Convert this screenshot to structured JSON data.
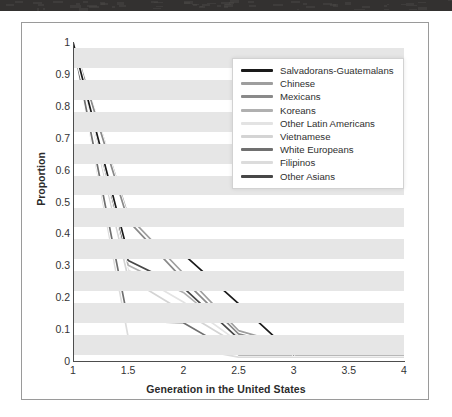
{
  "figure": {
    "y_axis_title": "Proportion",
    "x_axis_title": "Generation in the United States"
  },
  "legend": {
    "items": [
      {
        "label": "Salvadorans-Guatemalans",
        "color": "#1a1a1a"
      },
      {
        "label": "Chinese",
        "color": "#9e9e9e"
      },
      {
        "label": "Mexicans",
        "color": "#8a8a8a"
      },
      {
        "label": "Koreans",
        "color": "#b0b0b0"
      },
      {
        "label": "Other Latin Americans",
        "color": "#e3e3e3"
      },
      {
        "label": "Vietnamese",
        "color": "#d4d4d4"
      },
      {
        "label": "White Europeans",
        "color": "#707070"
      },
      {
        "label": "Filipinos",
        "color": "#dcdcdc"
      },
      {
        "label": "Other Asians",
        "color": "#474747"
      }
    ]
  },
  "chart_data": {
    "type": "line",
    "title": "",
    "xlabel": "Generation in the United States",
    "ylabel": "Proportion",
    "xlim": [
      1,
      4
    ],
    "ylim": [
      0,
      1
    ],
    "xticks": [
      "1",
      "1.5",
      "2",
      "2.5",
      "3",
      "3.5",
      "4"
    ],
    "yticks": [
      "0",
      "0.1",
      "0.2",
      "0.3",
      "0.4",
      "0.5",
      "0.6",
      "0.7",
      "0.8",
      "0.9",
      "1"
    ],
    "grid": false,
    "background_bands": "alternating horizontal light-gray stripes",
    "legend_position": "upper right",
    "x": [
      1,
      1.5,
      2,
      2.5,
      3,
      3.5,
      4
    ],
    "series": [
      {
        "name": "Salvadorans-Guatemalans",
        "color": "#1a1a1a",
        "values": [
          1.0,
          0.335,
          0.335,
          0.18,
          0.02,
          null,
          null
        ]
      },
      {
        "name": "Chinese",
        "color": "#9e9e9e",
        "values": [
          1.0,
          0.455,
          0.275,
          0.095,
          0.045,
          0.045,
          0.045
        ]
      },
      {
        "name": "Mexicans",
        "color": "#8a8a8a",
        "values": [
          1.0,
          0.44,
          0.255,
          0.085,
          0.04,
          0.04,
          0.04
        ]
      },
      {
        "name": "Koreans",
        "color": "#b0b0b0",
        "values": [
          1.0,
          0.3,
          0.215,
          0.075,
          0.03,
          0.03,
          0.03
        ]
      },
      {
        "name": "Other Latin Americans",
        "color": "#e3e3e3",
        "values": [
          1.0,
          0.285,
          0.185,
          0.06,
          0.025,
          0.025,
          0.025
        ]
      },
      {
        "name": "Vietnamese",
        "color": "#d4d4d4",
        "values": [
          1.0,
          0.26,
          0.155,
          0.05,
          0.02,
          0.02,
          0.02
        ]
      },
      {
        "name": "White Europeans",
        "color": "#707070",
        "values": [
          1.0,
          0.125,
          0.12,
          0.02,
          0.02,
          0.02,
          0.02
        ]
      },
      {
        "name": "Filipinos",
        "color": "#dcdcdc",
        "values": [
          1.0,
          0.075,
          0.045,
          0.012,
          0.012,
          0.012,
          0.012
        ]
      },
      {
        "name": "Other Asians",
        "color": "#474747",
        "values": [
          1.0,
          0.315,
          0.23,
          0.07,
          0.028,
          0.028,
          0.028
        ]
      }
    ]
  }
}
